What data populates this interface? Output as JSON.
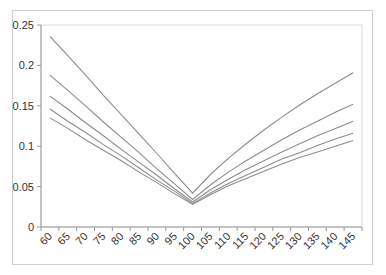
{
  "chart_data": {
    "type": "line",
    "title": "",
    "xlabel": "",
    "ylabel": "",
    "categories": [
      60,
      65,
      70,
      75,
      80,
      85,
      90,
      95,
      100,
      105,
      110,
      115,
      120,
      125,
      130,
      135,
      140,
      145
    ],
    "ylim": [
      0,
      0.25
    ],
    "yticks": [
      "0",
      "0.05",
      "0.1",
      "0.15",
      "0.2",
      "0.25"
    ],
    "grid": false,
    "legend": "none",
    "line_color": "#8c8c8c",
    "series": [
      {
        "name": "Series 1",
        "values": [
          0.236,
          0.212,
          0.188,
          0.163,
          0.139,
          0.115,
          0.091,
          0.066,
          0.042,
          0.065,
          0.085,
          0.103,
          0.12,
          0.136,
          0.151,
          0.165,
          0.178,
          0.191
        ]
      },
      {
        "name": "Series 2",
        "values": [
          0.188,
          0.169,
          0.15,
          0.13,
          0.111,
          0.092,
          0.072,
          0.053,
          0.034,
          0.052,
          0.068,
          0.082,
          0.095,
          0.108,
          0.12,
          0.131,
          0.142,
          0.152
        ]
      },
      {
        "name": "Series 3",
        "values": [
          0.162,
          0.146,
          0.129,
          0.113,
          0.096,
          0.08,
          0.064,
          0.047,
          0.031,
          0.046,
          0.059,
          0.071,
          0.082,
          0.093,
          0.103,
          0.113,
          0.122,
          0.131
        ]
      },
      {
        "name": "Series 4",
        "values": [
          0.146,
          0.131,
          0.117,
          0.102,
          0.088,
          0.073,
          0.058,
          0.044,
          0.029,
          0.042,
          0.054,
          0.064,
          0.074,
          0.084,
          0.092,
          0.101,
          0.109,
          0.116
        ]
      },
      {
        "name": "Series 5",
        "values": [
          0.135,
          0.122,
          0.108,
          0.095,
          0.082,
          0.068,
          0.055,
          0.041,
          0.028,
          0.04,
          0.051,
          0.06,
          0.069,
          0.078,
          0.086,
          0.093,
          0.1,
          0.107
        ]
      }
    ]
  }
}
